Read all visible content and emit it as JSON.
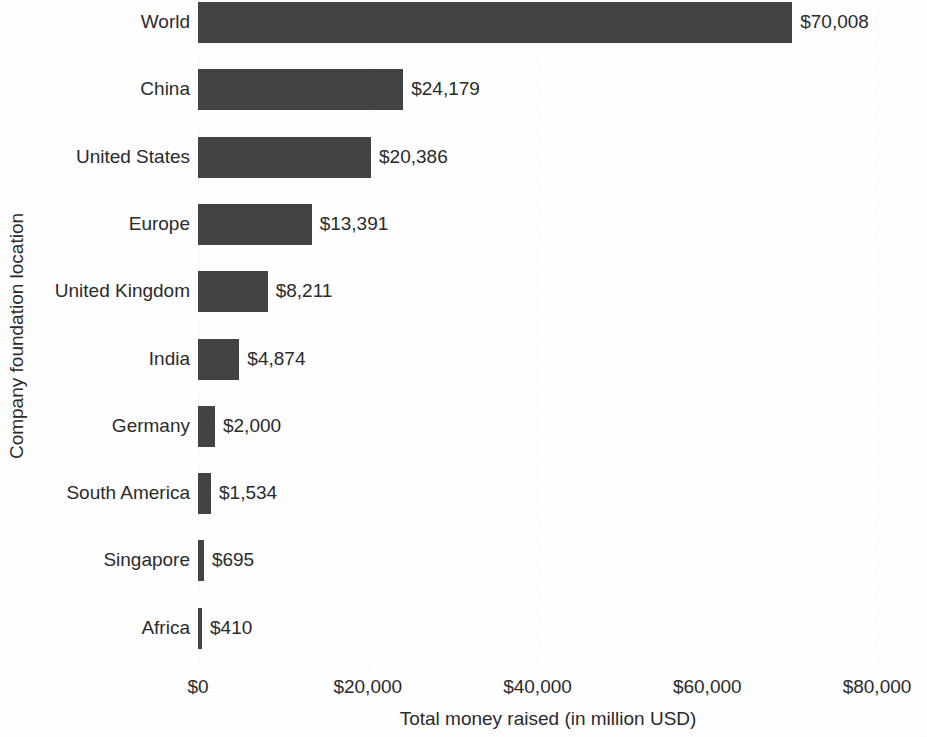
{
  "chart_data": {
    "type": "bar",
    "orientation": "horizontal",
    "title": "",
    "xlabel": "Total money raised (in million USD)",
    "ylabel": "Company foundation location",
    "categories": [
      "World",
      "China",
      "United States",
      "Europe",
      "United Kingdom",
      "India",
      "Germany",
      "South America",
      "Singapore",
      "Africa"
    ],
    "values": [
      70008,
      24179,
      20386,
      13391,
      8211,
      4874,
      2000,
      1534,
      695,
      410
    ],
    "value_labels": [
      "$70,008",
      "$24,179",
      "$20,386",
      "$13,391",
      "$8,211",
      "$4,874",
      "$2,000",
      "$1,534",
      "$695",
      "$410"
    ],
    "xlim": [
      0,
      80000
    ],
    "xticks": [
      0,
      20000,
      40000,
      60000,
      80000
    ],
    "xtick_labels": [
      "$0",
      "$20,000",
      "$40,000",
      "$60,000",
      "$80,000"
    ],
    "grid": false,
    "legend": null,
    "bar_color": "#434343",
    "text_color": "#2b2b2b",
    "background_color": "#ffffff"
  }
}
